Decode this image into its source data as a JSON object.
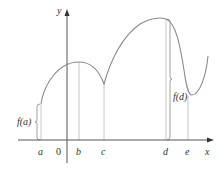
{
  "diagram": {
    "type": "function-graph",
    "axes": {
      "x_label": "x",
      "y_label": "y",
      "origin_label": "0"
    },
    "points": [
      {
        "name": "a",
        "label": "a"
      },
      {
        "name": "b",
        "label": "b"
      },
      {
        "name": "c",
        "label": "c"
      },
      {
        "name": "d",
        "label": "d"
      },
      {
        "name": "e",
        "label": "e"
      }
    ],
    "annotations": {
      "fa": "f(a)",
      "fd": "f(d)"
    },
    "colors": {
      "curve": "#8a8a8a",
      "axis": "#555555",
      "guide": "#c8c8c8",
      "text": "#333333"
    }
  }
}
